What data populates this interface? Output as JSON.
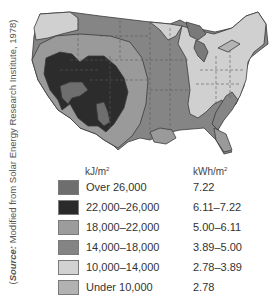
{
  "source": {
    "prefix": "(",
    "label": "Source:",
    "text": " Modified from Solar Energy Research Institute, 1978)"
  },
  "map": {
    "title": "Average daily solar radiation, contiguous United States",
    "colors": {
      "over_26000": "#6e6e6e",
      "22000_26000": "#2c2c2c",
      "18000_22000": "#9a9a9a",
      "14000_18000": "#858585",
      "10000_14000": "#d0d0d0",
      "under_10000": "#b4b4b4",
      "border": "#3a3a3a",
      "state_line": "#5a5a5a"
    }
  },
  "legend": {
    "header_kj": "kJ/m",
    "header_kj_sup": "2",
    "header_kwh": "kWh/m",
    "header_kwh_sup": "2",
    "rows": [
      {
        "kj": "Over 26,000",
        "kwh": "7.22",
        "color": "#6e6e6e"
      },
      {
        "kj": "22,000–26,000",
        "kwh": "6.11–7.22",
        "color": "#2a2a2a"
      },
      {
        "kj": "18,000–22,000",
        "kwh": "5.00–6.11",
        "color": "#9c9c9c"
      },
      {
        "kj": "14,000–18,000",
        "kwh": "3.89–5.00",
        "color": "#848484"
      },
      {
        "kj": "10,000–14,000",
        "kwh": "2.78–3.89",
        "color": "#d2d2d2"
      },
      {
        "kj": "Under 10,000",
        "kwh": "2.78",
        "color": "#b2b2b2"
      }
    ]
  }
}
